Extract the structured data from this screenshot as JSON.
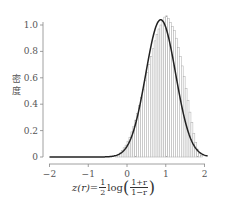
{
  "chart_data": {
    "type": "bar",
    "subtype": "histogram_with_density_curve",
    "title": "",
    "xlabel": "z(r) = 1/2 log((1+r)/(1−r))",
    "ylabel": "密度",
    "xlim": [
      -2,
      2.1
    ],
    "ylim": [
      0,
      1.08
    ],
    "x_ticks": [
      "−2",
      "−1",
      "0",
      "1",
      "2"
    ],
    "y_ticks": [
      "0",
      "0.2",
      "0.4",
      "0.6",
      "0.8",
      "1.0"
    ],
    "grid": false,
    "legend": null,
    "density_curve": {
      "description": "approximately normal density",
      "mean": 0.87,
      "sd": 0.385,
      "peak_density": 1.04
    },
    "histogram": {
      "bin_width": 0.05,
      "bin_start": -0.3,
      "densities": [
        0.01,
        0.02,
        0.03,
        0.05,
        0.07,
        0.09,
        0.12,
        0.15,
        0.19,
        0.23,
        0.28,
        0.33,
        0.39,
        0.45,
        0.51,
        0.58,
        0.64,
        0.7,
        0.76,
        0.82,
        0.88,
        0.93,
        0.97,
        1.0,
        1.03,
        1.06,
        1.07,
        1.05,
        1.02,
        0.99,
        0.96,
        0.9,
        0.83,
        0.76,
        0.69,
        0.61,
        0.52,
        0.43,
        0.34,
        0.26,
        0.18,
        0.11,
        0.06,
        0.03,
        0.01
      ]
    }
  },
  "labels": {
    "ylabel": "密度",
    "xlabel_lhs": "z(r)=",
    "xlabel_half_num": "1",
    "xlabel_half_den": "2",
    "xlabel_log": "log",
    "xlabel_frac_num": "1+r",
    "xlabel_frac_den": "1−r"
  }
}
